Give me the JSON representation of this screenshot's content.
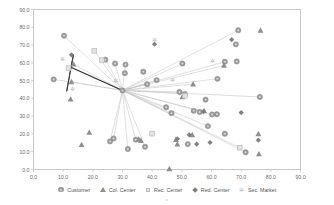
{
  "chart_data": {
    "type": "scatter",
    "title": "",
    "xlabel": "",
    "ylabel": "",
    "xlim": [
      0,
      90
    ],
    "ylim": [
      0,
      90
    ],
    "xticks": [
      "0.0",
      "10.0",
      "20.0",
      "30.0",
      "40.0",
      "50.0",
      "60.0",
      "70.0",
      "80.0",
      "90.0"
    ],
    "yticks": [
      "0.0",
      "10.0",
      "20.0",
      "30.0",
      "40.0",
      "50.0",
      "60.0",
      "70.0",
      "80.0",
      "90.0"
    ],
    "grid": false,
    "legend_position": "bottom",
    "series": [
      {
        "name": "Customer",
        "marker": "circle",
        "color": "#9a9a9a",
        "points": [
          [
            10.3,
            75.2
          ],
          [
            6.8,
            50.7
          ],
          [
            24.2,
            61.8
          ],
          [
            27.5,
            59.6
          ],
          [
            31.0,
            59.0
          ],
          [
            30.8,
            54.2
          ],
          [
            37.0,
            55.0
          ],
          [
            38.3,
            48.0
          ],
          [
            41.5,
            50.3
          ],
          [
            50.2,
            59.6
          ],
          [
            62.0,
            51.0
          ],
          [
            64.5,
            60.6
          ],
          [
            68.5,
            60.8
          ],
          [
            68.2,
            70.4
          ],
          [
            69.0,
            78.3
          ],
          [
            76.3,
            40.8
          ],
          [
            58.0,
            39.3
          ],
          [
            60.2,
            31.0
          ],
          [
            61.8,
            31.1
          ],
          [
            58.8,
            24.4
          ],
          [
            49.2,
            43.6
          ],
          [
            51.0,
            42.5
          ],
          [
            44.7,
            35.0
          ],
          [
            46.5,
            31.7
          ],
          [
            54.0,
            33.0
          ],
          [
            56.0,
            32.4
          ],
          [
            64.5,
            20.1
          ],
          [
            71.5,
            9.7
          ],
          [
            25.8,
            15.8
          ],
          [
            27.0,
            17.5
          ],
          [
            34.5,
            16.8
          ],
          [
            37.6,
            12.8
          ],
          [
            31.8,
            11.5
          ],
          [
            52.0,
            14.3
          ]
        ]
      },
      {
        "name": "Col. Center",
        "marker": "triangle",
        "color": "#8e8e8e",
        "points": [
          [
            13.5,
            59.2
          ],
          [
            12.8,
            49.3
          ],
          [
            12.5,
            39.5
          ],
          [
            16.2,
            13.9
          ],
          [
            18.8,
            20.8
          ],
          [
            35.5,
            17.0
          ],
          [
            36.2,
            16.2
          ],
          [
            45.8,
            0.3
          ],
          [
            48.0,
            16.8
          ],
          [
            50.2,
            40.8
          ],
          [
            53.5,
            19.5
          ],
          [
            53.8,
            48.0
          ],
          [
            57.5,
            33.0
          ],
          [
            64.2,
            58.5
          ],
          [
            75.8,
            20.0
          ],
          [
            76.0,
            8.7
          ],
          [
            76.5,
            78.3
          ],
          [
            48.5,
            14.2
          ]
        ]
      },
      {
        "name": "Rec. Center",
        "marker": "square",
        "color": "#e2e2e2",
        "points": [
          [
            11.8,
            57.0
          ],
          [
            20.5,
            66.8
          ],
          [
            23.0,
            61.5
          ],
          [
            40.0,
            20.2
          ],
          [
            51.0,
            41.5
          ],
          [
            69.5,
            12.3
          ]
        ]
      },
      {
        "name": "Red. Center",
        "marker": "diamond",
        "color": "#808080",
        "points": [
          [
            40.8,
            70.5
          ],
          [
            12.8,
            64.5
          ],
          [
            48.5,
            17.3
          ],
          [
            52.5,
            19.5
          ],
          [
            55.0,
            14.3
          ],
          [
            57.3,
            32.6
          ],
          [
            59.5,
            15.2
          ],
          [
            70.0,
            32.0
          ],
          [
            75.8,
            16.5
          ],
          [
            66.8,
            73.0
          ]
        ]
      },
      {
        "name": "Sec. Market",
        "marker": "star",
        "color": "#b9b9b9",
        "points": [
          [
            9.8,
            62.0
          ],
          [
            40.8,
            73.2
          ],
          [
            60.5,
            61.0
          ],
          [
            27.5,
            50.0
          ],
          [
            47.0,
            50.5
          ],
          [
            13.0,
            45.2
          ]
        ]
      }
    ],
    "hub": [
      30.0,
      44.5
    ],
    "secondary_hub": [
      12.6,
      57.5
    ],
    "spokes_from_hub": [
      [
        10.3,
        75.2
      ],
      [
        6.8,
        50.7
      ],
      [
        24.2,
        61.8
      ],
      [
        27.5,
        59.6
      ],
      [
        31.0,
        59.0
      ],
      [
        31.8,
        11.5
      ],
      [
        25.8,
        15.8
      ],
      [
        27.0,
        17.5
      ],
      [
        34.5,
        16.8
      ],
      [
        37.6,
        12.8
      ],
      [
        41.5,
        50.3
      ],
      [
        50.2,
        59.6
      ],
      [
        64.5,
        60.6
      ],
      [
        69.0,
        78.3
      ],
      [
        64.2,
        58.5
      ],
      [
        76.3,
        40.8
      ],
      [
        62.0,
        51.0
      ],
      [
        53.8,
        48.0
      ],
      [
        49.2,
        43.6
      ],
      [
        51.0,
        42.5
      ],
      [
        44.7,
        35.0
      ],
      [
        46.5,
        31.7
      ],
      [
        57.3,
        32.6
      ],
      [
        60.2,
        31.0
      ],
      [
        58.8,
        24.4
      ],
      [
        71.5,
        9.7
      ],
      [
        69.5,
        12.3
      ],
      [
        12.6,
        57.5
      ],
      [
        13.5,
        59.2
      ],
      [
        20.5,
        66.8
      ],
      [
        38.3,
        48.0
      ],
      [
        12.8,
        49.3
      ]
    ],
    "dark_spokes": [
      [
        12.6,
        57.5,
        13.5,
        64.8
      ],
      [
        12.6,
        57.5,
        11.2,
        44.0
      ],
      [
        12.6,
        57.5,
        11.8,
        57.0
      ],
      [
        13.5,
        64.8,
        11.2,
        44.0
      ]
    ]
  },
  "legend": {
    "items": [
      {
        "label": "Customer",
        "marker": "circle-marker"
      },
      {
        "label": "Col. Center",
        "marker": "triangle-marker"
      },
      {
        "label": "Rec. Center",
        "marker": "square-marker"
      },
      {
        "label": "Red. Center",
        "marker": "diamond-marker"
      },
      {
        "label": "Sec. Market",
        "marker": "star-marker"
      }
    ]
  }
}
